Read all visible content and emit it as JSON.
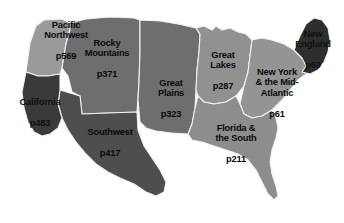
{
  "map": {
    "title": "United States Regions Guide Map",
    "type": "choropleth-region-map",
    "background_color": "#ffffff",
    "border_color": "#f2f2f2",
    "label_color": "#0a0a0a",
    "regions": [
      {
        "id": "pacific-northwest",
        "name": "Pacific\nNorthwest",
        "page": "p569",
        "fill": "#9a9a9a",
        "tone": "light",
        "label_x": 66,
        "label_y": 41
      },
      {
        "id": "california",
        "name": "California",
        "page": "p483",
        "fill": "#3a3a3a",
        "tone": "darkest",
        "label_x": 40,
        "label_y": 112
      },
      {
        "id": "rocky-mountains",
        "name": "Rocky\nMountains",
        "page": "p371",
        "fill": "#6e6e6e",
        "tone": "medium",
        "label_x": 107,
        "label_y": 59
      },
      {
        "id": "southwest",
        "name": "Southwest",
        "page": "p417",
        "fill": "#4e4e4e",
        "tone": "dark",
        "label_x": 110,
        "label_y": 142
      },
      {
        "id": "great-plains",
        "name": "Great\nPlains",
        "page": "p323",
        "fill": "#6e6e6e",
        "tone": "medium",
        "label_x": 171,
        "label_y": 99
      },
      {
        "id": "great-lakes",
        "name": "Great\nLakes",
        "page": "p287",
        "fill": "#919191",
        "tone": "lightest",
        "label_x": 223,
        "label_y": 71
      },
      {
        "id": "florida-and-the-south",
        "name": "Florida &\nthe South",
        "page": "p211",
        "fill": "#8d8d8d",
        "tone": "lightest",
        "label_x": 236,
        "label_y": 144
      },
      {
        "id": "new-york-and-the-mid-atlantic",
        "name": "New York\n& the Mid-\nAtlantic",
        "page": "p61",
        "fill": "#949494",
        "tone": "lightest",
        "label_x": 277,
        "label_y": 93
      },
      {
        "id": "new-england",
        "name": "New\nEngland",
        "page": "p69",
        "fill": "#2e2e2e",
        "tone": "darkest",
        "label_x": 313,
        "label_y": 50
      }
    ]
  }
}
